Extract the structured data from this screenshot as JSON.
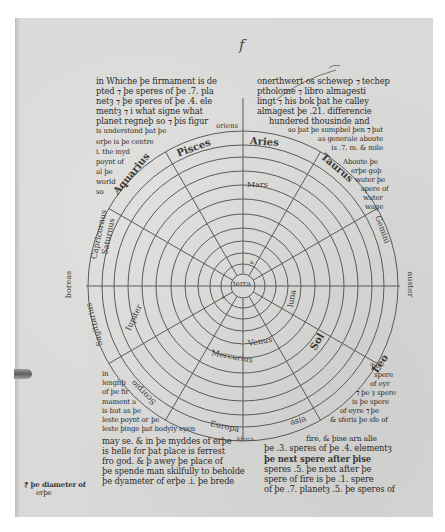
{
  "folio_mark": "f",
  "diagram": {
    "center": "terra",
    "zodiac": [
      "Aries",
      "Taurus",
      "Gemini",
      "Cancer",
      "Leo",
      "Virgo",
      "Libra",
      "Scorpio",
      "Sagittarius",
      "Capricornus",
      "Aquarius",
      "Pisces"
    ],
    "zodiac_visible_labels": {
      "aries": "Aries",
      "taurus": "Taurus",
      "gemini": "Gemini",
      "pisces": "Pisces",
      "aquarius": "Aquarius",
      "capricornus": "Capricornus",
      "saturnus_ring": "Saturnus",
      "sagittarius": "Sagittarius",
      "scorpio": "Scorpio",
      "leo": "Leo"
    },
    "planet_labels": {
      "mars": "Mars",
      "sol": "Sol",
      "luna": "luna",
      "venus": "Venus",
      "mercurius": "Mercurius",
      "iupiter": "Iupiter"
    },
    "element_labels": {
      "terra": "terra",
      "a": "a",
      "i": "i"
    },
    "cardinal_labels": {
      "west": "boreas",
      "east": "auster",
      "top": "oriens",
      "bottom_left": "Europa",
      "bottom_right": "asia",
      "bottom": "Africa"
    }
  },
  "text_upper_left": [
    "in Whiche þe firmament is de",
    "pted ⁊ þe speres of þe .7. pla",
    "netȝ ⁊ þe speres of þe .4. ele",
    "mentȝ ⁊ i what signe what",
    "planet regneþ so ⁊ þis figur",
    "is understond þat þe",
    "erþe is þe centre",
    "i. the myd",
    "poynt of",
    "al þe",
    "world",
    "so"
  ],
  "text_upper_right": [
    "onerthwert os schewep ⁊ techep",
    "ptholome ⁊ libro almagesti",
    "lingt ⁊ his bok þat he calley",
    "almagest þe .21. differencie",
    "hundered thousinde and",
    "so þat þe sumpbel þen ⁊ þat",
    "as generale aboute",
    "is .7. m. & mile",
    "Aboute þe",
    "erþe goþ",
    "water þe",
    "spere of",
    "water",
    "wage"
  ],
  "text_right_side": [
    "ⁱþe",
    "spere",
    "of eyr",
    "⁊ þe ȝ spere",
    "is þe spere",
    "of eyre ⁊ þe",
    "& sferis þe sfe of",
    "fire, & þise arn alle",
    "þe .3. speres of þe .4. elementȝ"
  ],
  "text_lower_left": [
    "in",
    "lenghþ",
    "of þe fir",
    "mament a",
    "is but as þe",
    "leste poynt or þe",
    "leste þinge þat bodyly eyen",
    "may se. & in þe myddes of erþe",
    "is helle for þat place is ferrest",
    "fro god. & þ awey þe place of",
    "þe spende man skilfully to beholde",
    "þe dyameter of erþe .i. þe brede"
  ],
  "text_lower_right": [
    "þe next spere after þise",
    "speres .5. þe next after þe",
    "spere of fire is þe .1. spere",
    "of þe .7. planetȝ .5. þe speres of"
  ],
  "margin_note": [
    "⁋ þe diameter of",
    "erþe"
  ],
  "colors": {
    "parchment": "#d9d9d7",
    "ink": "#2c2c2a",
    "line": "#5a5a58",
    "border": "#ffffff"
  }
}
